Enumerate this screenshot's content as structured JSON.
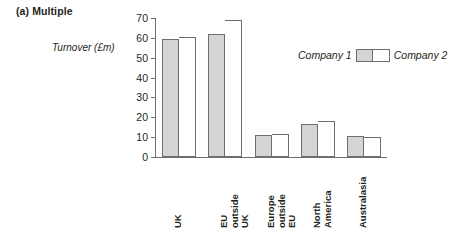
{
  "panel": {
    "caption": "(a) Multiple"
  },
  "chart_data": {
    "type": "bar",
    "title": "(a) Multiple",
    "xlabel": "",
    "ylabel": "Turnover (£m)",
    "ylim": [
      0,
      70
    ],
    "yticks": [
      0,
      10,
      20,
      30,
      40,
      50,
      60,
      70
    ],
    "ytick_labels": [
      "0",
      "10",
      "20",
      "30",
      "40",
      "50",
      "60",
      "70"
    ],
    "grid": false,
    "legend_position": "inside-right",
    "categories": [
      "UK",
      "EU\noutside\nUK",
      "Europe\noutside\nEU",
      "North\nAmerica",
      "Australasia"
    ],
    "series": [
      {
        "name": "Company 1",
        "color": "#d4d4d4",
        "values": [
          59.5,
          62,
          11,
          16.5,
          10.5
        ]
      },
      {
        "name": "Company 2",
        "color": "#ffffff",
        "values": [
          60.5,
          69,
          11.5,
          18,
          10
        ]
      }
    ]
  }
}
